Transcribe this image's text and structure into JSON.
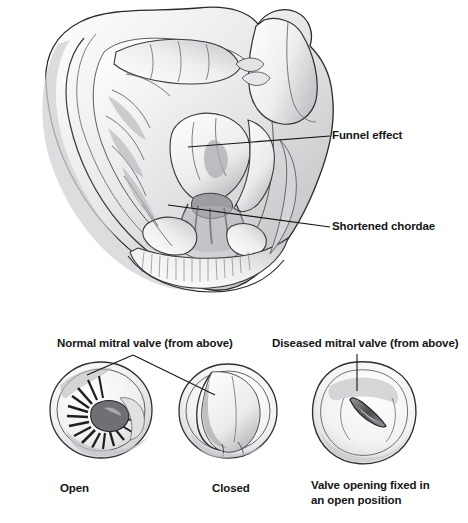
{
  "figure": {
    "style": "pencil-sketch-grayscale",
    "background_color": "#ffffff",
    "ink_color": "#151515"
  },
  "main_illustration": {
    "name": "heart-cross-section",
    "description": "Cutaway pencil drawing of the heart showing left ventricle, mitral valve and chordae tendineae",
    "callouts": [
      {
        "id": "funnel",
        "label": "Funnel effect"
      },
      {
        "id": "chordae",
        "label": "Shortened chordae"
      }
    ]
  },
  "valve_panels": {
    "heading_left": "Normal mitral valve (from above)",
    "heading_right": "Diseased mitral valve (from above)",
    "items": [
      {
        "id": "open",
        "caption": "Open",
        "state": "normal-open"
      },
      {
        "id": "closed",
        "caption": "Closed",
        "state": "normal-closed"
      },
      {
        "id": "stenotic",
        "caption_line1": "Valve opening fixed in",
        "caption_line2": "an open position",
        "state": "diseased-fixed-open"
      }
    ]
  }
}
